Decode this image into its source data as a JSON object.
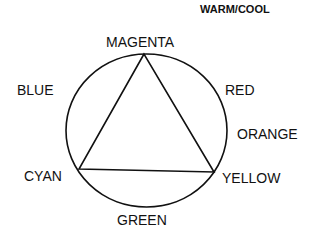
{
  "title": "WARM/COOL",
  "labels": {
    "magenta": "MAGENTA",
    "blue": "BLUE",
    "red": "RED",
    "orange": "ORANGE",
    "cyan": "CYAN",
    "yellow": "YELLOW",
    "green": "GREEN"
  },
  "shapes": {
    "circle": {
      "cx": 146.5,
      "cy": 130.5,
      "rx": 80.5,
      "ry": 76.5
    },
    "triangle": [
      [
        144,
        54
      ],
      [
        79,
        169
      ],
      [
        214,
        172
      ]
    ],
    "stroke_color": "#111111"
  }
}
